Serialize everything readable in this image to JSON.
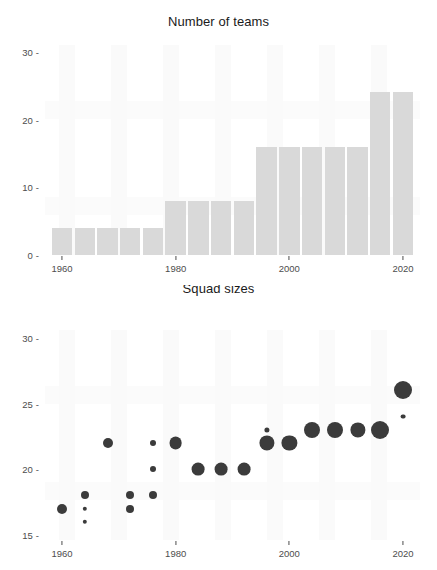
{
  "figure": {
    "background_color": "#ffffff",
    "bar_color": "#d9d9d9",
    "point_color": "#3b3b3b",
    "axis_text_color": "#4d4d4d"
  },
  "panels": [
    {
      "id": "teams",
      "title": "Number of teams"
    },
    {
      "id": "squads",
      "title": "Squad sizes"
    }
  ],
  "chart_data": [
    {
      "type": "bar",
      "title": "Number of teams",
      "xlabel": "",
      "ylabel": "",
      "xlim": [
        1957,
        2023
      ],
      "ylim": [
        0,
        31
      ],
      "grid": false,
      "legend": false,
      "xticks": [
        "1960",
        "1980",
        "2000",
        "2020"
      ],
      "xtick_values": [
        1960,
        1980,
        2000,
        2020
      ],
      "yticks": [
        "0",
        "10",
        "20",
        "30"
      ],
      "ytick_values": [
        0,
        10,
        20,
        30
      ],
      "x": [
        1960,
        1964,
        1968,
        1972,
        1976,
        1980,
        1984,
        1988,
        1992,
        1996,
        2000,
        2004,
        2008,
        2012,
        2016,
        2020
      ],
      "values": [
        4,
        4,
        4,
        4,
        4,
        8,
        8,
        8,
        8,
        16,
        16,
        16,
        16,
        16,
        24,
        24
      ],
      "bar_width_years": 3.6
    },
    {
      "type": "scatter",
      "title": "Squad sizes",
      "xlabel": "",
      "ylabel": "",
      "xlim": [
        1957,
        2023
      ],
      "ylim": [
        14.6,
        30.6
      ],
      "grid": false,
      "legend": false,
      "xticks": [
        "1960",
        "1980",
        "2000",
        "2020"
      ],
      "xtick_values": [
        1960,
        1980,
        2000,
        2020
      ],
      "yticks": [
        "15",
        "20",
        "25",
        "30"
      ],
      "ytick_values": [
        15,
        20,
        25,
        30
      ],
      "size_encodes": "number of teams with that squad size",
      "points": [
        {
          "x": 1960,
          "y": 17,
          "size": 5.0
        },
        {
          "x": 1964,
          "y": 18,
          "size": 4.0
        },
        {
          "x": 1964,
          "y": 17,
          "size": 2.2
        },
        {
          "x": 1964,
          "y": 16,
          "size": 2.2
        },
        {
          "x": 1968,
          "y": 22,
          "size": 5.0
        },
        {
          "x": 1972,
          "y": 18,
          "size": 4.0
        },
        {
          "x": 1972,
          "y": 17,
          "size": 4.0
        },
        {
          "x": 1976,
          "y": 22,
          "size": 3.0
        },
        {
          "x": 1976,
          "y": 20,
          "size": 3.0
        },
        {
          "x": 1976,
          "y": 18,
          "size": 4.0
        },
        {
          "x": 1980,
          "y": 22,
          "size": 6.4
        },
        {
          "x": 1984,
          "y": 20,
          "size": 6.4
        },
        {
          "x": 1988,
          "y": 20,
          "size": 6.4
        },
        {
          "x": 1992,
          "y": 20,
          "size": 6.4
        },
        {
          "x": 1996,
          "y": 23,
          "size": 2.6
        },
        {
          "x": 1996,
          "y": 22,
          "size": 7.6
        },
        {
          "x": 2000,
          "y": 22,
          "size": 7.6
        },
        {
          "x": 2004,
          "y": 23,
          "size": 8.0
        },
        {
          "x": 2008,
          "y": 23,
          "size": 8.0
        },
        {
          "x": 2012,
          "y": 23,
          "size": 7.6
        },
        {
          "x": 2016,
          "y": 23,
          "size": 9.0
        },
        {
          "x": 2020,
          "y": 26,
          "size": 9.0
        },
        {
          "x": 2020,
          "y": 24,
          "size": 2.4
        }
      ]
    }
  ]
}
